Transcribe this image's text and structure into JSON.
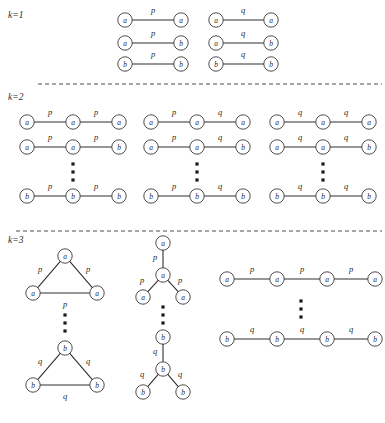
{
  "figure": {
    "width": 385,
    "height": 423,
    "background": "#ffffff",
    "node_radius": 7.2,
    "colors": {
      "stroke": "#2f2f2f",
      "node_stroke": "#3a3a3a",
      "node_fill": "#ffffff",
      "text": "#2b2b2b",
      "separator": "#3a3a3a"
    }
  },
  "sections": [
    {
      "id": "k1",
      "label": "k=1",
      "label_pos": [
        8,
        18
      ],
      "separator": null,
      "graphs": [
        {
          "name": "k1-col1-row1",
          "type": "path",
          "nodes": [
            {
              "label": "a",
              "x": 125,
              "y": 20
            },
            {
              "label": "a",
              "x": 181,
              "y": 20
            }
          ],
          "edges": [
            {
              "from": 0,
              "to": 1,
              "label": "p",
              "label_pos": [
                153,
                13
              ]
            }
          ]
        },
        {
          "name": "k1-col1-row2",
          "type": "path",
          "nodes": [
            {
              "label": "a",
              "x": 125,
              "y": 43
            },
            {
              "label": "b",
              "x": 181,
              "y": 43
            }
          ],
          "edges": [
            {
              "from": 0,
              "to": 1,
              "label": "p",
              "label_pos": [
                153,
                36
              ]
            }
          ]
        },
        {
          "name": "k1-col1-row3",
          "type": "path",
          "nodes": [
            {
              "label": "b",
              "x": 125,
              "y": 64
            },
            {
              "label": "b",
              "x": 181,
              "y": 64
            }
          ],
          "edges": [
            {
              "from": 0,
              "to": 1,
              "label": "p",
              "label_pos": [
                153,
                57
              ]
            }
          ]
        },
        {
          "name": "k1-col2-row1",
          "type": "path",
          "nodes": [
            {
              "label": "a",
              "x": 216,
              "y": 20
            },
            {
              "label": "a",
              "x": 271,
              "y": 20
            }
          ],
          "edges": [
            {
              "from": 0,
              "to": 1,
              "label": "q",
              "label_pos": [
                243,
                13
              ]
            }
          ]
        },
        {
          "name": "k1-col2-row2",
          "type": "path",
          "nodes": [
            {
              "label": "a",
              "x": 216,
              "y": 43
            },
            {
              "label": "b",
              "x": 271,
              "y": 43
            }
          ],
          "edges": [
            {
              "from": 0,
              "to": 1,
              "label": "q",
              "label_pos": [
                243,
                36
              ]
            }
          ]
        },
        {
          "name": "k1-col2-row3",
          "type": "path",
          "nodes": [
            {
              "label": "b",
              "x": 216,
              "y": 64
            },
            {
              "label": "b",
              "x": 271,
              "y": 64
            }
          ],
          "edges": [
            {
              "from": 0,
              "to": 1,
              "label": "q",
              "label_pos": [
                243,
                57
              ]
            }
          ]
        }
      ],
      "ellipses": []
    },
    {
      "id": "k2",
      "label": "k=2",
      "label_pos": [
        8,
        100
      ],
      "separator": {
        "x1": 38,
        "x2": 382,
        "y": 84
      },
      "graphs": [
        {
          "name": "k2-col1-row1",
          "type": "path",
          "nodes": [
            {
              "label": "a",
              "x": 27,
              "y": 122
            },
            {
              "label": "a",
              "x": 73,
              "y": 122
            },
            {
              "label": "a",
              "x": 119,
              "y": 122
            }
          ],
          "edges": [
            {
              "from": 0,
              "to": 1,
              "label": "p",
              "label_pos": [
                50,
                115
              ]
            },
            {
              "from": 1,
              "to": 2,
              "label": "p",
              "label_pos": [
                96,
                115
              ]
            }
          ]
        },
        {
          "name": "k2-col1-row2",
          "type": "path",
          "nodes": [
            {
              "label": "a",
              "x": 27,
              "y": 147
            },
            {
              "label": "a",
              "x": 73,
              "y": 147
            },
            {
              "label": "b",
              "x": 119,
              "y": 147
            }
          ],
          "edges": [
            {
              "from": 0,
              "to": 1,
              "label": "p",
              "label_pos": [
                50,
                140
              ]
            },
            {
              "from": 1,
              "to": 2,
              "label": "p",
              "label_pos": [
                96,
                140
              ]
            }
          ]
        },
        {
          "name": "k2-col1-row3",
          "type": "path",
          "nodes": [
            {
              "label": "b",
              "x": 27,
              "y": 196
            },
            {
              "label": "b",
              "x": 73,
              "y": 196
            },
            {
              "label": "b",
              "x": 119,
              "y": 196
            }
          ],
          "edges": [
            {
              "from": 0,
              "to": 1,
              "label": "p",
              "label_pos": [
                50,
                189
              ]
            },
            {
              "from": 1,
              "to": 2,
              "label": "p",
              "label_pos": [
                96,
                189
              ]
            }
          ]
        },
        {
          "name": "k2-col2-row1",
          "type": "path",
          "nodes": [
            {
              "label": "a",
              "x": 151,
              "y": 122
            },
            {
              "label": "a",
              "x": 197,
              "y": 122
            },
            {
              "label": "a",
              "x": 243,
              "y": 122
            }
          ],
          "edges": [
            {
              "from": 0,
              "to": 1,
              "label": "p",
              "label_pos": [
                174,
                115
              ]
            },
            {
              "from": 1,
              "to": 2,
              "label": "q",
              "label_pos": [
                220,
                115
              ]
            }
          ]
        },
        {
          "name": "k2-col2-row2",
          "type": "path",
          "nodes": [
            {
              "label": "a",
              "x": 151,
              "y": 147
            },
            {
              "label": "a",
              "x": 197,
              "y": 147
            },
            {
              "label": "b",
              "x": 243,
              "y": 147
            }
          ],
          "edges": [
            {
              "from": 0,
              "to": 1,
              "label": "p",
              "label_pos": [
                174,
                140
              ]
            },
            {
              "from": 1,
              "to": 2,
              "label": "q",
              "label_pos": [
                220,
                140
              ]
            }
          ]
        },
        {
          "name": "k2-col2-row3",
          "type": "path",
          "nodes": [
            {
              "label": "b",
              "x": 151,
              "y": 196
            },
            {
              "label": "b",
              "x": 197,
              "y": 196
            },
            {
              "label": "b",
              "x": 243,
              "y": 196
            }
          ],
          "edges": [
            {
              "from": 0,
              "to": 1,
              "label": "p",
              "label_pos": [
                174,
                189
              ]
            },
            {
              "from": 1,
              "to": 2,
              "label": "q",
              "label_pos": [
                220,
                189
              ]
            }
          ]
        },
        {
          "name": "k2-col3-row1",
          "type": "path",
          "nodes": [
            {
              "label": "a",
              "x": 277,
              "y": 122
            },
            {
              "label": "a",
              "x": 323,
              "y": 122
            },
            {
              "label": "a",
              "x": 369,
              "y": 122
            }
          ],
          "edges": [
            {
              "from": 0,
              "to": 1,
              "label": "q",
              "label_pos": [
                300,
                115
              ]
            },
            {
              "from": 1,
              "to": 2,
              "label": "q",
              "label_pos": [
                346,
                115
              ]
            }
          ]
        },
        {
          "name": "k2-col3-row2",
          "type": "path",
          "nodes": [
            {
              "label": "a",
              "x": 277,
              "y": 147
            },
            {
              "label": "a",
              "x": 323,
              "y": 147
            },
            {
              "label": "b",
              "x": 369,
              "y": 147
            }
          ],
          "edges": [
            {
              "from": 0,
              "to": 1,
              "label": "q",
              "label_pos": [
                300,
                140
              ]
            },
            {
              "from": 1,
              "to": 2,
              "label": "q",
              "label_pos": [
                346,
                140
              ]
            }
          ]
        },
        {
          "name": "k2-col3-row3",
          "type": "path",
          "nodes": [
            {
              "label": "b",
              "x": 277,
              "y": 196
            },
            {
              "label": "b",
              "x": 323,
              "y": 196
            },
            {
              "label": "b",
              "x": 369,
              "y": 196
            }
          ],
          "edges": [
            {
              "from": 0,
              "to": 1,
              "label": "q",
              "label_pos": [
                300,
                189
              ]
            },
            {
              "from": 1,
              "to": 2,
              "label": "q",
              "label_pos": [
                346,
                189
              ]
            }
          ]
        }
      ],
      "ellipses": [
        {
          "name": "k2-col1-ellipsis",
          "x": 73,
          "y": 172,
          "dots": 3
        },
        {
          "name": "k2-col2-ellipsis",
          "x": 197,
          "y": 172,
          "dots": 3
        },
        {
          "name": "k2-col3-ellipsis",
          "x": 323,
          "y": 172,
          "dots": 3
        }
      ]
    },
    {
      "id": "k3",
      "label": "k=3",
      "label_pos": [
        8,
        243
      ],
      "separator": {
        "x1": 16,
        "x2": 382,
        "y": 231
      },
      "graphs": [
        {
          "name": "k3-triangle-top",
          "type": "triangle",
          "nodes": [
            {
              "label": "a",
              "x": 65,
              "y": 256
            },
            {
              "label": "a",
              "x": 33,
              "y": 293
            },
            {
              "label": "a",
              "x": 97,
              "y": 293
            }
          ],
          "edges": [
            {
              "from": 0,
              "to": 1,
              "label": "p",
              "label_pos": [
                40,
                272
              ]
            },
            {
              "from": 0,
              "to": 2,
              "label": "p",
              "label_pos": [
                88,
                272
              ]
            },
            {
              "from": 1,
              "to": 2,
              "label": "p",
              "label_pos": [
                65,
                307
              ]
            }
          ]
        },
        {
          "name": "k3-triangle-bottom",
          "type": "triangle",
          "nodes": [
            {
              "label": "b",
              "x": 65,
              "y": 348
            },
            {
              "label": "b",
              "x": 33,
              "y": 385
            },
            {
              "label": "b",
              "x": 97,
              "y": 385
            }
          ],
          "edges": [
            {
              "from": 0,
              "to": 1,
              "label": "q",
              "label_pos": [
                40,
                364
              ]
            },
            {
              "from": 0,
              "to": 2,
              "label": "q",
              "label_pos": [
                88,
                364
              ]
            },
            {
              "from": 1,
              "to": 2,
              "label": "q",
              "label_pos": [
                65,
                399
              ]
            }
          ]
        },
        {
          "name": "k3-star-top",
          "type": "star",
          "nodes": [
            {
              "label": "a",
              "x": 163,
              "y": 243
            },
            {
              "label": "a",
              "x": 163,
              "y": 275
            },
            {
              "label": "a",
              "x": 143,
              "y": 297
            },
            {
              "label": "a",
              "x": 183,
              "y": 297
            }
          ],
          "edges": [
            {
              "from": 0,
              "to": 1,
              "label": "p",
              "label_pos": [
                155,
                260
              ]
            },
            {
              "from": 1,
              "to": 2,
              "label": "p",
              "label_pos": [
                142,
                283
              ]
            },
            {
              "from": 1,
              "to": 3,
              "label": "p",
              "label_pos": [
                180,
                283
              ]
            }
          ]
        },
        {
          "name": "k3-star-bottom",
          "type": "star",
          "nodes": [
            {
              "label": "b",
              "x": 163,
              "y": 337
            },
            {
              "label": "b",
              "x": 163,
              "y": 369
            },
            {
              "label": "b",
              "x": 143,
              "y": 392
            },
            {
              "label": "b",
              "x": 183,
              "y": 392
            }
          ],
          "edges": [
            {
              "from": 0,
              "to": 1,
              "label": "q",
              "label_pos": [
                155,
                354
              ]
            },
            {
              "from": 1,
              "to": 2,
              "label": "q",
              "label_pos": [
                142,
                377
              ]
            },
            {
              "from": 1,
              "to": 3,
              "label": "q",
              "label_pos": [
                180,
                377
              ]
            }
          ]
        },
        {
          "name": "k3-path-top",
          "type": "path",
          "nodes": [
            {
              "label": "a",
              "x": 227,
              "y": 279
            },
            {
              "label": "a",
              "x": 277,
              "y": 279
            },
            {
              "label": "a",
              "x": 327,
              "y": 279
            },
            {
              "label": "a",
              "x": 375,
              "y": 279
            }
          ],
          "edges": [
            {
              "from": 0,
              "to": 1,
              "label": "p",
              "label_pos": [
                252,
                272
              ]
            },
            {
              "from": 1,
              "to": 2,
              "label": "p",
              "label_pos": [
                302,
                272
              ]
            },
            {
              "from": 2,
              "to": 3,
              "label": "p",
              "label_pos": [
                351,
                272
              ]
            }
          ]
        },
        {
          "name": "k3-path-bottom",
          "type": "path",
          "nodes": [
            {
              "label": "b",
              "x": 227,
              "y": 339
            },
            {
              "label": "b",
              "x": 277,
              "y": 339
            },
            {
              "label": "b",
              "x": 327,
              "y": 339
            },
            {
              "label": "b",
              "x": 375,
              "y": 339
            }
          ],
          "edges": [
            {
              "from": 0,
              "to": 1,
              "label": "q",
              "label_pos": [
                252,
                332
              ]
            },
            {
              "from": 1,
              "to": 2,
              "label": "q",
              "label_pos": [
                302,
                332
              ]
            },
            {
              "from": 2,
              "to": 3,
              "label": "q",
              "label_pos": [
                351,
                332
              ]
            }
          ]
        }
      ],
      "ellipses": [
        {
          "name": "k3-triangle-ellipsis",
          "x": 65,
          "y": 323,
          "dots": 3
        },
        {
          "name": "k3-star-ellipsis",
          "x": 163,
          "y": 315,
          "dots": 3
        },
        {
          "name": "k3-path-ellipsis",
          "x": 301,
          "y": 309,
          "dots": 3
        }
      ]
    }
  ]
}
